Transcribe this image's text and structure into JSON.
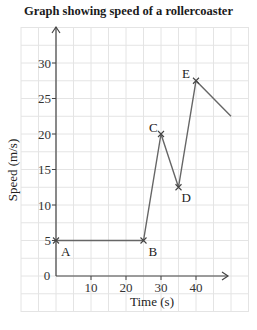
{
  "chart_data": {
    "type": "line",
    "title": "Graph showing speed of a rollercoaster",
    "xlabel": "Time (s)",
    "ylabel": "Speed (m/s)",
    "xlim": [
      0,
      50
    ],
    "ylim": [
      0,
      33
    ],
    "grid": true,
    "x_ticks": [
      10,
      20,
      30,
      40
    ],
    "y_ticks": [
      0,
      5,
      10,
      15,
      20,
      25,
      30
    ],
    "origin_label": "0",
    "series": [
      {
        "name": "Speed",
        "color": "#555555",
        "points": [
          {
            "label": "A",
            "x": 0,
            "y": 5,
            "marker": true
          },
          {
            "label": "B",
            "x": 25,
            "y": 5,
            "marker": true
          },
          {
            "label": "C",
            "x": 30,
            "y": 20,
            "marker": true
          },
          {
            "label": "D",
            "x": 35,
            "y": 12.5,
            "marker": true
          },
          {
            "label": "E",
            "x": 40,
            "y": 27.5,
            "marker": true
          },
          {
            "label": "",
            "x": 50,
            "y": 22.5,
            "marker": false
          }
        ]
      }
    ]
  },
  "colors": {
    "grid": "#e4e4e4",
    "axis": "#444444",
    "line": "#666666",
    "text": "#222222"
  }
}
